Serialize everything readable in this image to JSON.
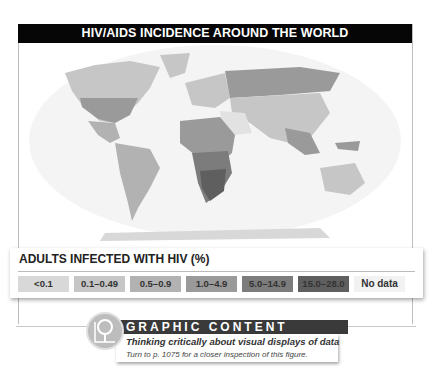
{
  "figure": {
    "title": "HIV/AIDS INCIDENCE AROUND THE WORLD"
  },
  "legend": {
    "title": "ADULTS INFECTED WITH HIV (%)",
    "items": [
      {
        "label": "<0.1",
        "color": "#d8d8d8"
      },
      {
        "label": "0.1–0.49",
        "color": "#c6c6c6"
      },
      {
        "label": "0.5–0.9",
        "color": "#b2b2b2"
      },
      {
        "label": "1.0–4.9",
        "color": "#9a9a9a"
      },
      {
        "label": "5.0–14.9",
        "color": "#7c7c7c"
      },
      {
        "label": "15.0–28.0",
        "color": "#5f5f5f"
      },
      {
        "label": "No data",
        "color": "#f2f2f2"
      }
    ]
  },
  "callout": {
    "heading": "GRAPHIC CONTENT",
    "subheading": "Thinking critically about visual displays of data",
    "note": "Turn to p. 1075 for a closer inspection of this figure.",
    "icon": "magnifier-chart-icon"
  }
}
